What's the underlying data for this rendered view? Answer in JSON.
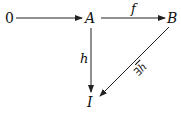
{
  "diagram": {
    "nodes": [
      {
        "id": "zero",
        "label": "0"
      },
      {
        "id": "A",
        "label": "A"
      },
      {
        "id": "B",
        "label": "B"
      },
      {
        "id": "I",
        "label": "I"
      }
    ],
    "edges": [
      {
        "from": "zero",
        "to": "A",
        "label": ""
      },
      {
        "from": "A",
        "to": "B",
        "label": "f"
      },
      {
        "from": "A",
        "to": "I",
        "label": "h"
      },
      {
        "from": "B",
        "to": "I",
        "label": "∃h̄",
        "quantifier": "∃",
        "symbol": "h"
      }
    ],
    "line_color": "#222222"
  }
}
